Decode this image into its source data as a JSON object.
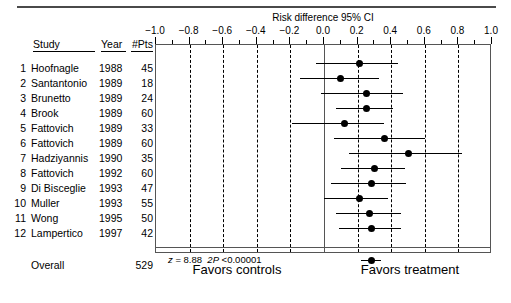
{
  "chart_data": {
    "type": "scatter",
    "title": "Risk difference 95% CI",
    "xlabel": "",
    "ylabel": "",
    "xlim": [
      -1.0,
      1.0
    ],
    "xticks": [
      -1.0,
      -0.8,
      -0.6,
      -0.4,
      -0.2,
      0.0,
      0.2,
      0.4,
      0.6,
      0.8,
      1.0
    ],
    "xticklabels": [
      "−1.0",
      "−0.8",
      "−0.6",
      "−0.4",
      "−0.2",
      "0.0",
      "0.2",
      "0.4",
      "0.6",
      "0.8",
      "1.0"
    ],
    "minor_tick_step": 0.1,
    "grid": "vertical dashed at every 0.2",
    "null_line": 0.0,
    "legend": "none",
    "columns": [
      "",
      "Study",
      "Year",
      "#Pts"
    ],
    "rows": [
      {
        "no": "1",
        "study": "Hoofnagle",
        "year": "1988",
        "pts": "45",
        "estimate": 0.21,
        "ci_low": -0.05,
        "ci_high": 0.44
      },
      {
        "no": "2",
        "study": "Santantonio",
        "year": "1989",
        "pts": "18",
        "estimate": 0.1,
        "ci_low": -0.14,
        "ci_high": 0.33
      },
      {
        "no": "3",
        "study": "Brunetto",
        "year": "1989",
        "pts": "24",
        "estimate": 0.25,
        "ci_low": -0.02,
        "ci_high": 0.47
      },
      {
        "no": "4",
        "study": "Brook",
        "year": "1989",
        "pts": "60",
        "estimate": 0.25,
        "ci_low": 0.07,
        "ci_high": 0.41
      },
      {
        "no": "5",
        "study": "Fattovich",
        "year": "1989",
        "pts": "33",
        "estimate": 0.12,
        "ci_low": -0.19,
        "ci_high": 0.36
      },
      {
        "no": "6",
        "study": "Fattovich",
        "year": "1989",
        "pts": "60",
        "estimate": 0.36,
        "ci_low": 0.06,
        "ci_high": 0.6
      },
      {
        "no": "7",
        "study": "Hadziyannis",
        "year": "1990",
        "pts": "35",
        "estimate": 0.5,
        "ci_low": 0.15,
        "ci_high": 0.82
      },
      {
        "no": "8",
        "study": "Fattovich",
        "year": "1992",
        "pts": "60",
        "estimate": 0.3,
        "ci_low": 0.1,
        "ci_high": 0.48
      },
      {
        "no": "9",
        "study": "Di Bisceglie",
        "year": "1993",
        "pts": "47",
        "estimate": 0.28,
        "ci_low": 0.04,
        "ci_high": 0.49
      },
      {
        "no": "10",
        "study": "Muller",
        "year": "1993",
        "pts": "55",
        "estimate": 0.21,
        "ci_low": 0.0,
        "ci_high": 0.38
      },
      {
        "no": "11",
        "study": "Wong",
        "year": "1995",
        "pts": "50",
        "estimate": 0.27,
        "ci_low": 0.07,
        "ci_high": 0.46
      },
      {
        "no": "12",
        "study": "Lampertico",
        "year": "1997",
        "pts": "42",
        "estimate": 0.28,
        "ci_low": 0.09,
        "ci_high": 0.46
      }
    ],
    "overall": {
      "label": "Overall",
      "pts": "529",
      "estimate": 0.28,
      "ci_low": 0.22,
      "ci_high": 0.34
    }
  },
  "axis": {
    "title": "Risk difference 95% CI"
  },
  "table": {
    "header": {
      "study": "Study",
      "year": "Year",
      "pts": "#Pts"
    }
  },
  "statistics": {
    "z_label": "z",
    "z_eq": "=",
    "z_value": "8.88",
    "p_label": "2P",
    "p_value": "<0.00001"
  },
  "footer": {
    "left": "Favors controls",
    "right": "Favors treatment"
  },
  "colors": {
    "marker": "#000000",
    "frame": "#555555",
    "grid": "#000000",
    "rule": "#4a4a4a"
  }
}
